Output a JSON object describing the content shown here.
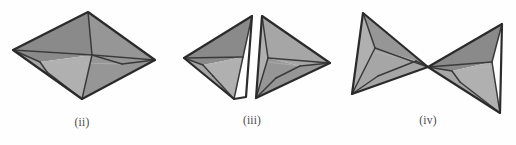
{
  "plate": {
    "title": "Polyhedron dissection figures",
    "background_color": "#fefefe",
    "width": 516,
    "height": 145
  },
  "style_colors": {
    "outline": "#2b2b2b",
    "interior_line": "#3a3a3a",
    "faint_line": "#b4b4b4",
    "face_dark": "#8a8a8a",
    "face_mid": "#969696",
    "face_light": "#a6a6a6",
    "face_lighter": "#b0b0b0",
    "face_palest": "#bdbdbd",
    "caption_color": "#4a4a4a"
  },
  "figures": [
    {
      "id": "figure-ii",
      "caption": "(ii)",
      "description": "Assembled square bipyramid shown as a flattened rhombus with internal fold edges",
      "piece_count": 1,
      "pieces": [
        {
          "name": "full-bipyramid",
          "faces": [
            {
              "name": "upper-left-face",
              "shade": "face_dark",
              "points": "13,50 88,12 92,55 40,62"
            },
            {
              "name": "upper-right-face",
              "shade": "face_mid",
              "points": "88,12 155,60 122,64 92,55"
            },
            {
              "name": "left-inner-face",
              "shade": "face_light",
              "points": "13,50 40,62 47,72 82,99"
            },
            {
              "name": "center-face",
              "shade": "face_lighter",
              "points": "92,55 82,99 47,72 40,62"
            },
            {
              "name": "right-inner-face",
              "shade": "face_mid",
              "points": "92,55 122,64 155,60 82,99"
            }
          ],
          "outline": "13,50 88,12 155,60 82,99",
          "fold_edges": [
            "88,12 92,55",
            "92,55 82,99",
            "13,50 92,55",
            "92,55 155,60",
            "40,62 47,72",
            "40,62 13,50",
            "122,64 92,55",
            "47,72 82,99",
            "122,64 155,60"
          ],
          "faint_edges": [
            "13,50 155,60",
            "40,62 122,64"
          ]
        }
      ]
    },
    {
      "id": "figure-iii",
      "caption": "(iii)",
      "description": "The bipyramid split into two mirrored tetrahedral halves separated by a vertical gap",
      "piece_count": 2,
      "pieces": [
        {
          "name": "left-half-tetrahedron",
          "faces": [
            {
              "name": "upper-face",
              "shade": "face_dark",
              "points": "184,58 252,16 243,57 203,65"
            },
            {
              "name": "lower-face",
              "shade": "face_light",
              "points": "184,58 203,65 213,76 234,99"
            },
            {
              "name": "inner-face",
              "shade": "face_lighter",
              "points": "243,57 234,99 213,76 203,65"
            }
          ],
          "outline": "184,58 252,16 246,97 234,99",
          "fold_edges": [
            "252,16 243,57",
            "243,57 234,99",
            "184,58 243,57",
            "203,65 213,76",
            "184,58 203,65",
            "213,76 234,99"
          ],
          "faint_edges": [
            "203,65 243,60"
          ]
        },
        {
          "name": "right-half-tetrahedron",
          "faces": [
            {
              "name": "upper-face",
              "shade": "face_light",
              "points": "262,16 330,63 300,66 268,58"
            },
            {
              "name": "inner-face",
              "shade": "face_lighter",
              "points": "262,16 268,58 276,78 256,98"
            },
            {
              "name": "lower-face",
              "shade": "face_mid",
              "points": "268,58 300,66 330,63 256,98"
            }
          ],
          "outline": "262,16 330,63 256,98",
          "fold_edges": [
            "262,16 268,58",
            "268,58 256,98",
            "268,58 330,63",
            "300,66 276,78",
            "300,66 330,63",
            "276,78 256,98"
          ],
          "faint_edges": [
            "268,62 300,66"
          ]
        }
      ]
    },
    {
      "id": "figure-iv",
      "caption": "(iv)",
      "description": "The two tetrahedral halves rotated to meet tip to tip forming a bowtie",
      "piece_count": 2,
      "pieces": [
        {
          "name": "left-tetrahedron",
          "faces": [
            {
              "name": "upper-face",
              "shade": "face_mid",
              "points": "363,13 428,67 416,61 375,48"
            },
            {
              "name": "inner-face",
              "shade": "face_lighter",
              "points": "363,13 375,48 378,76 352,94"
            },
            {
              "name": "lower-face",
              "shade": "face_light",
              "points": "375,48 416,61 428,67 352,94"
            }
          ],
          "outline": "363,13 428,67 352,94",
          "fold_edges": [
            "363,13 375,48",
            "375,48 352,94",
            "375,48 428,67",
            "416,61 378,76",
            "416,61 428,67",
            "378,76 352,94"
          ],
          "faint_edges": [
            "375,52 416,61"
          ]
        },
        {
          "name": "right-tetrahedron",
          "faces": [
            {
              "name": "upper-face",
              "shade": "face_dark",
              "points": "428,67 502,24 492,62 452,71"
            },
            {
              "name": "lower-face",
              "shade": "face_light",
              "points": "428,67 452,71 460,82 500,113"
            },
            {
              "name": "inner-face",
              "shade": "face_lighter",
              "points": "492,62 500,113 460,82 452,71"
            }
          ],
          "outline": "428,67 502,24 500,113",
          "fold_edges": [
            "502,24 492,62",
            "492,62 500,113",
            "428,67 492,62",
            "452,71 460,82",
            "428,67 452,71",
            "460,82 500,113"
          ],
          "faint_edges": [
            "452,71 492,66"
          ]
        }
      ]
    }
  ]
}
